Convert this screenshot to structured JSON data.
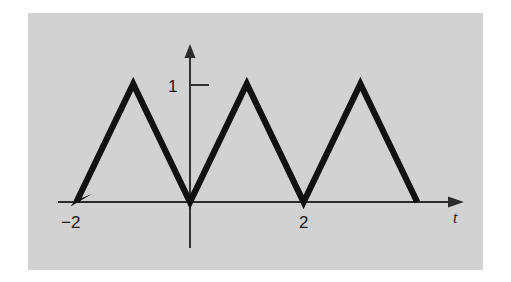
{
  "figure": {
    "kind": "triangular-wave-plot",
    "panel_background": "#d2d2d2",
    "page_background": "#ffffff",
    "curve_color": "#111111",
    "axis_color": "#2b2b2b"
  },
  "axes": {
    "x_axis_name": "t",
    "y_axis_name": "",
    "x_tick_labels": [
      "−2",
      "2"
    ],
    "y_tick_labels": [
      "1"
    ],
    "x_tick_minus_two": "−2",
    "x_tick_two": "2",
    "y_tick_one": "1"
  },
  "chart_data": {
    "type": "line",
    "title": "",
    "subtitle": "",
    "xlabel": "t",
    "ylabel": "",
    "grid": false,
    "legend": null,
    "xlim": [
      -2.6,
      4.9
    ],
    "ylim": [
      -0.45,
      1.45
    ],
    "x_ticks": [
      -2,
      2
    ],
    "x_tick_labels": [
      "−2",
      "2"
    ],
    "y_ticks": [
      1
    ],
    "y_tick_labels": [
      "1"
    ],
    "annotations": [
      {
        "text": "arrowhead on waveform at t = -2 pointing down-left",
        "x": -2,
        "y": 0
      },
      {
        "text": "arrowhead on t-axis pointing right",
        "x": 4.9,
        "y": 0
      },
      {
        "text": "arrowhead on vertical axis pointing up",
        "x": 0,
        "y": 1.35
      }
    ],
    "series": [
      {
        "name": "triangular wave",
        "period": 2,
        "amplitude": 1,
        "x": [
          -2,
          -1,
          0,
          1,
          2,
          3,
          4
        ],
        "y": [
          0,
          1,
          0,
          1,
          0,
          1,
          0
        ]
      }
    ]
  }
}
